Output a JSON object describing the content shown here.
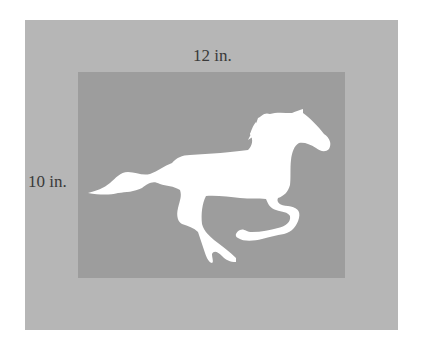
{
  "figure": {
    "labels": {
      "width": "12 in.",
      "height": "10 in."
    },
    "picture": {
      "width_in": 12,
      "height_in": 10,
      "icon": "horse-silhouette-icon"
    },
    "colors": {
      "frame": "#b6b6b6",
      "picture_background": "#9d9d9d",
      "horse": "#ffffff",
      "label_text": "#3a3a3a"
    }
  }
}
